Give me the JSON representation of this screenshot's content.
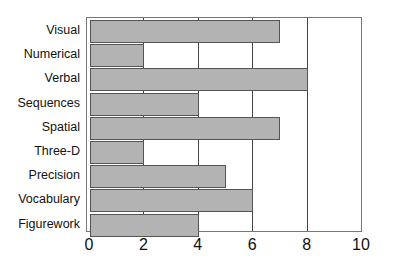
{
  "chart_data": {
    "type": "bar",
    "orientation": "horizontal",
    "title": "",
    "xlabel": "",
    "ylabel": "",
    "categories": [
      "Visual",
      "Numerical",
      "Verbal",
      "Sequences",
      "Spatial",
      "Three-D",
      "Precision",
      "Vocabulary",
      "Figurework"
    ],
    "values": [
      7,
      2,
      8,
      4,
      7,
      2,
      5,
      6,
      4
    ],
    "xlim": [
      0,
      10
    ],
    "xticks": [
      "0",
      "2",
      "4",
      "6",
      "8",
      "10"
    ],
    "grid": "vertical",
    "bar_color": "#b3b3b3",
    "legend": null
  }
}
